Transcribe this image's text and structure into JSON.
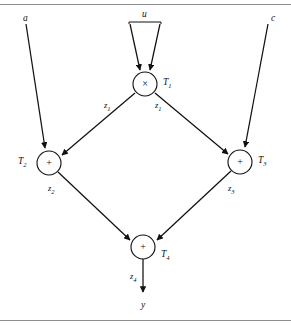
{
  "figure": {
    "rules": {
      "top": true,
      "bottom": true
    },
    "stroke_color": "#111111",
    "rule_color": "#8d8d8d",
    "background": "#ffffff"
  },
  "inputs": [
    {
      "id": "a",
      "label": "a",
      "x": 23,
      "y": 14
    },
    {
      "id": "u",
      "label": "u",
      "x": 142,
      "y": 10
    },
    {
      "id": "c",
      "label": "c",
      "x": 271,
      "y": 14
    }
  ],
  "outputs": [
    {
      "id": "y",
      "label": "y",
      "x": 141,
      "y": 301
    }
  ],
  "nodes": [
    {
      "id": "T1",
      "op": "×",
      "task_label": "T",
      "task_sub": "1",
      "cx": 145,
      "cy": 84,
      "r": 12,
      "label_x": 163,
      "label_y": 78
    },
    {
      "id": "T2",
      "op": "+",
      "task_label": "T",
      "task_sub": "2",
      "cx": 49,
      "cy": 163,
      "r": 12,
      "label_x": 18,
      "label_y": 157
    },
    {
      "id": "T3",
      "op": "+",
      "task_label": "T",
      "task_sub": "3",
      "cx": 240,
      "cy": 162,
      "r": 12,
      "label_x": 258,
      "label_y": 156
    },
    {
      "id": "T4",
      "op": "+",
      "task_label": "T",
      "task_sub": "4",
      "cx": 143,
      "cy": 247,
      "r": 12,
      "label_x": 161,
      "label_y": 250
    }
  ],
  "edge_labels": [
    {
      "id": "z1-left",
      "label": "z",
      "sub": "1",
      "x": 104,
      "y": 101
    },
    {
      "id": "z1-right",
      "label": "z",
      "sub": "1",
      "x": 155,
      "y": 101
    },
    {
      "id": "z2",
      "label": "z",
      "sub": "2",
      "x": 48,
      "y": 184
    },
    {
      "id": "z3",
      "label": "z",
      "sub": "3",
      "x": 228,
      "y": 184
    },
    {
      "id": "z4",
      "label": "z",
      "sub": "4",
      "x": 130,
      "y": 272
    }
  ],
  "edges": [
    {
      "from": "a",
      "to": "T2",
      "label": ""
    },
    {
      "from": "u",
      "to": "T1",
      "label": "",
      "note": "forked, two arrowheads"
    },
    {
      "from": "c",
      "to": "T3",
      "label": ""
    },
    {
      "from": "T1",
      "to": "T2",
      "label": "z1"
    },
    {
      "from": "T1",
      "to": "T3",
      "label": "z1"
    },
    {
      "from": "T2",
      "to": "T4",
      "label": "z2"
    },
    {
      "from": "T3",
      "to": "T4",
      "label": "z3"
    },
    {
      "from": "T4",
      "to": "y",
      "label": "z4"
    }
  ]
}
